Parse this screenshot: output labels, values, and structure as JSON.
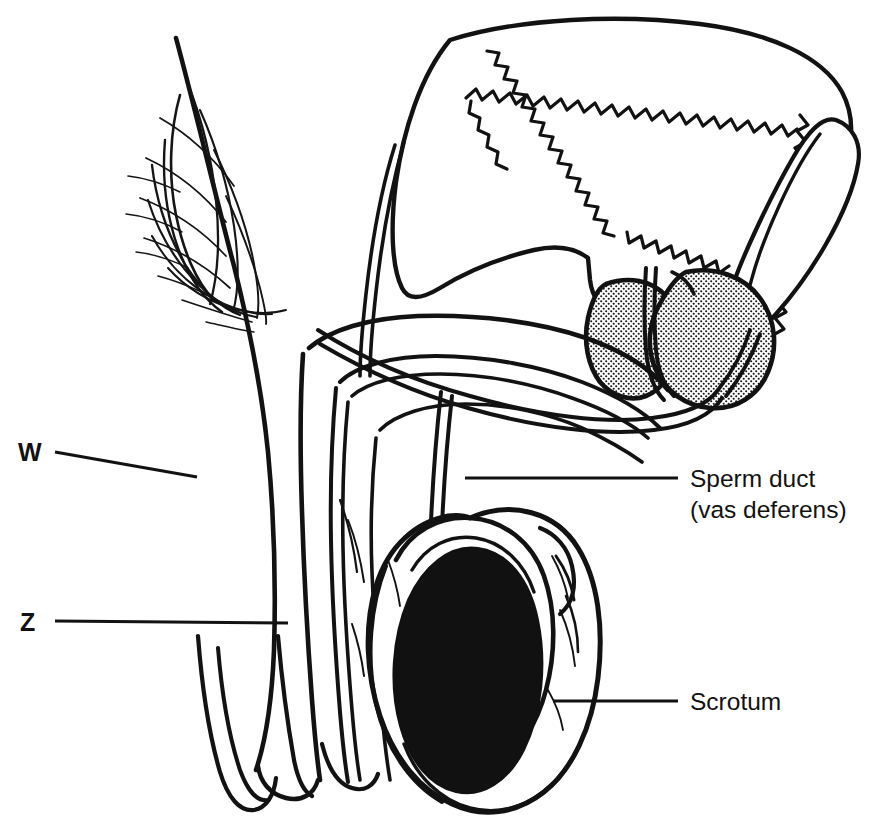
{
  "diagram": {
    "type": "anatomical-line-diagram",
    "background_color": "#ffffff",
    "ink_color": "#121212"
  },
  "labels": {
    "w": {
      "text": "W",
      "style": "bold-code",
      "x": 18,
      "y": 460,
      "leader_from": [
        55,
        452
      ],
      "leader_to": [
        197,
        477
      ]
    },
    "z": {
      "text": "Z",
      "style": "bold-code",
      "x": 20,
      "y": 624,
      "leader_from": [
        55,
        620
      ],
      "leader_to": [
        288,
        622
      ]
    },
    "sperm_duct": {
      "line1": "Sperm duct",
      "line2": "(vas deferens)",
      "style": "regular",
      "x": 690,
      "y1": 478,
      "y2": 509,
      "leader_from": [
        465,
        478
      ],
      "leader_to": [
        678,
        478
      ]
    },
    "scrotum": {
      "text": "Scrotum",
      "style": "regular",
      "x": 690,
      "y": 710,
      "leader_from": [
        553,
        701
      ],
      "leader_to": [
        678,
        701
      ]
    }
  },
  "structures": [
    {
      "name": "abdominal-wall",
      "description": "Sloping anterior abdominal wall line from upper left down to pelvic floor"
    },
    {
      "name": "pubic-hair",
      "description": "Crossed curved hair strokes over the lower abdominal wall"
    },
    {
      "name": "bladder",
      "description": "Large triangular bladder with wavy mucosal inner lining"
    },
    {
      "name": "bladder-mucosa",
      "description": "Scalloped wavy inner lining of the bladder"
    },
    {
      "name": "ureter",
      "description": "Narrow double-line tube ascending from bladder apex"
    },
    {
      "name": "seminal-vesicle",
      "description": "Elongated lobed sac posterior to the bladder on the right"
    },
    {
      "name": "prostate-gland",
      "description": "Two stippled lobes beneath the bladder neck"
    },
    {
      "name": "urethra",
      "description": "Channel running from bladder neck through the prostate into the penis"
    },
    {
      "name": "penis",
      "description": "Shaft curving down and left from the pubic region"
    },
    {
      "name": "glans-penis",
      "description": "Rounded tip at the lower end of the penile shaft"
    },
    {
      "name": "vas-deferens",
      "description": "Narrow double-line sperm duct running from the epididymis up over the bladder"
    },
    {
      "name": "epididymis",
      "description": "Curved arc hugging the top and side of the testis"
    },
    {
      "name": "testis",
      "description": "Solid black oval gonad inside the scrotal sac"
    },
    {
      "name": "scrotum",
      "description": "Outer sac enclosing the testis and epididymis"
    }
  ],
  "texture": {
    "prostate_pattern": "stipple-dots",
    "testis_fill": "#111111"
  }
}
